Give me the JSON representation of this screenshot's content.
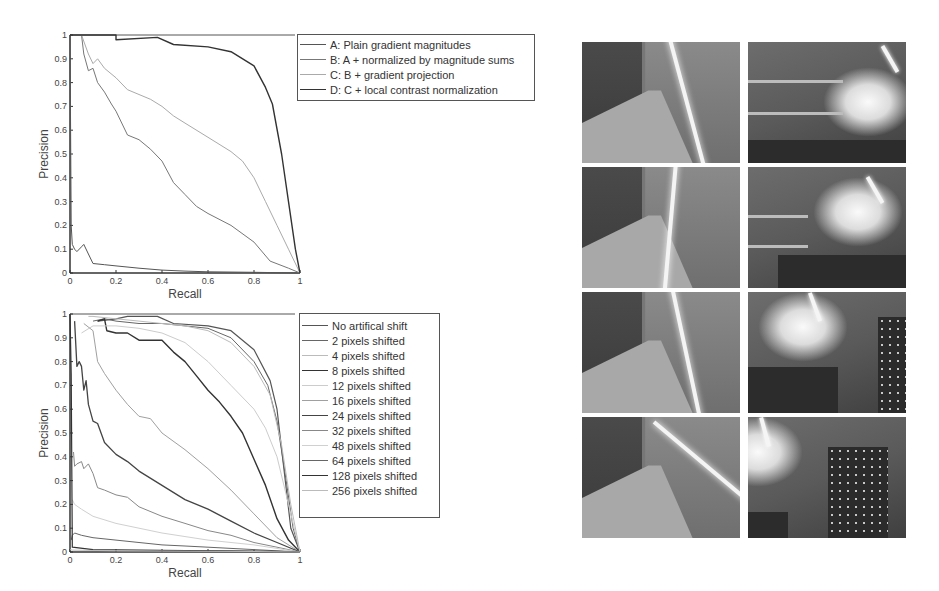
{
  "chart_data": [
    {
      "type": "line",
      "title": "",
      "xlabel": "Recall",
      "ylabel": "Precision",
      "xlim": [
        0,
        1
      ],
      "ylim": [
        0,
        1
      ],
      "xticks": [
        "0",
        "0.2",
        "0.4",
        "0.6",
        "0.8",
        "1"
      ],
      "yticks": [
        "0",
        "0.1",
        "0.2",
        "0.3",
        "0.4",
        "0.5",
        "0.6",
        "0.7",
        "0.8",
        "0.9",
        "1"
      ],
      "grid": false,
      "legend_position": "outside-right-top",
      "series": [
        {
          "name": "A: Plain gradient magnitudes",
          "color": "#555555",
          "width": 1,
          "x": [
            0,
            0.005,
            0.01,
            0.02,
            0.03,
            0.05,
            0.06,
            0.08,
            0.1,
            0.15,
            0.2,
            0.3,
            0.4,
            0.5,
            0.6,
            0.8,
            1.0
          ],
          "y": [
            1.0,
            0.2,
            0.12,
            0.1,
            0.09,
            0.11,
            0.12,
            0.08,
            0.04,
            0.035,
            0.03,
            0.02,
            0.012,
            0.008,
            0.005,
            0.003,
            0.0
          ]
        },
        {
          "name": "B: A + normalized by magnitude sums",
          "color": "#777777",
          "width": 1,
          "x": [
            0.05,
            0.06,
            0.08,
            0.1,
            0.12,
            0.15,
            0.18,
            0.2,
            0.25,
            0.3,
            0.35,
            0.4,
            0.45,
            0.5,
            0.55,
            0.6,
            0.7,
            0.8,
            0.87,
            0.95,
            1.0
          ],
          "y": [
            1.0,
            0.92,
            0.85,
            0.86,
            0.8,
            0.76,
            0.71,
            0.68,
            0.58,
            0.56,
            0.52,
            0.47,
            0.38,
            0.33,
            0.28,
            0.25,
            0.2,
            0.13,
            0.05,
            0.02,
            0.0
          ]
        },
        {
          "name": "C: B + gradient projection",
          "color": "#aaaaaa",
          "width": 1,
          "x": [
            0.05,
            0.08,
            0.1,
            0.12,
            0.15,
            0.2,
            0.25,
            0.3,
            0.35,
            0.4,
            0.45,
            0.5,
            0.6,
            0.7,
            0.75,
            0.8,
            0.85,
            0.9,
            0.95,
            1.0
          ],
          "y": [
            1.0,
            0.92,
            0.88,
            0.9,
            0.86,
            0.82,
            0.77,
            0.75,
            0.73,
            0.7,
            0.66,
            0.63,
            0.57,
            0.51,
            0.47,
            0.4,
            0.3,
            0.2,
            0.1,
            0.0
          ]
        },
        {
          "name": "D: C + local contrast normalization",
          "color": "#333333",
          "width": 1.4,
          "x": [
            0,
            0.2,
            0.2,
            0.38,
            0.45,
            0.6,
            0.7,
            0.8,
            0.85,
            0.88,
            0.92,
            0.95,
            0.98,
            1.0
          ],
          "y": [
            1.0,
            1.0,
            0.98,
            0.99,
            0.96,
            0.95,
            0.93,
            0.87,
            0.78,
            0.71,
            0.5,
            0.3,
            0.1,
            0.0
          ]
        }
      ]
    },
    {
      "type": "line",
      "title": "",
      "xlabel": "Recall",
      "ylabel": "Precision",
      "xlim": [
        0,
        1
      ],
      "ylim": [
        0,
        1
      ],
      "xticks": [
        "0",
        "0.2",
        "0.4",
        "0.6",
        "0.8",
        "1"
      ],
      "yticks": [
        "0",
        "0.1",
        "0.2",
        "0.3",
        "0.4",
        "0.5",
        "0.6",
        "0.7",
        "0.8",
        "0.9",
        "1"
      ],
      "grid": false,
      "legend_position": "outside-right-top",
      "series": [
        {
          "name": "No artifical shift",
          "color": "#555555",
          "width": 1.2,
          "x": [
            0.12,
            0.2,
            0.25,
            0.38,
            0.45,
            0.6,
            0.7,
            0.8,
            0.87,
            0.9,
            0.93,
            0.96,
            1.0
          ],
          "y": [
            0.97,
            0.98,
            0.99,
            0.99,
            0.96,
            0.95,
            0.93,
            0.85,
            0.72,
            0.6,
            0.35,
            0.1,
            0.0
          ]
        },
        {
          "name": "2 pixels shifted",
          "color": "#666666",
          "width": 1,
          "x": [
            0.1,
            0.15,
            0.2,
            0.3,
            0.4,
            0.5,
            0.6,
            0.7,
            0.8,
            0.86,
            0.9,
            0.94,
            0.97,
            1.0
          ],
          "y": [
            0.97,
            0.98,
            0.97,
            0.96,
            0.96,
            0.95,
            0.94,
            0.9,
            0.8,
            0.7,
            0.55,
            0.3,
            0.1,
            0.0
          ]
        },
        {
          "name": "4 pixels shifted",
          "color": "#bbbbbb",
          "width": 1,
          "x": [
            0.08,
            0.1,
            0.2,
            0.3,
            0.4,
            0.5,
            0.6,
            0.7,
            0.8,
            0.87,
            0.92,
            0.96,
            1.0
          ],
          "y": [
            0.99,
            0.99,
            0.98,
            0.97,
            0.96,
            0.95,
            0.93,
            0.88,
            0.78,
            0.66,
            0.45,
            0.2,
            0.0
          ]
        },
        {
          "name": "8 pixels shifted",
          "color": "#333333",
          "width": 1.4,
          "x": [
            0.12,
            0.15,
            0.16,
            0.2,
            0.25,
            0.3,
            0.35,
            0.4,
            0.45,
            0.5,
            0.55,
            0.6,
            0.65,
            0.7,
            0.75,
            0.8,
            0.85,
            0.9,
            0.95,
            1.0
          ],
          "y": [
            0.97,
            0.98,
            0.93,
            0.92,
            0.92,
            0.89,
            0.89,
            0.89,
            0.84,
            0.8,
            0.74,
            0.68,
            0.63,
            0.57,
            0.5,
            0.39,
            0.28,
            0.14,
            0.05,
            0.0
          ]
        },
        {
          "name": "12 pixels shifted",
          "color": "#cccccc",
          "width": 1,
          "x": [
            0.05,
            0.1,
            0.2,
            0.3,
            0.4,
            0.5,
            0.6,
            0.7,
            0.8,
            0.85,
            0.9,
            0.95,
            1.0
          ],
          "y": [
            0.92,
            0.95,
            0.95,
            0.94,
            0.92,
            0.88,
            0.8,
            0.7,
            0.6,
            0.52,
            0.4,
            0.2,
            0.0
          ]
        },
        {
          "name": "16 pixels shifted",
          "color": "#a0a0a0",
          "width": 1,
          "x": [
            0.06,
            0.1,
            0.12,
            0.15,
            0.2,
            0.25,
            0.3,
            0.35,
            0.4,
            0.5,
            0.6,
            0.7,
            0.8,
            0.9,
            1.0
          ],
          "y": [
            0.96,
            0.93,
            0.8,
            0.75,
            0.68,
            0.62,
            0.57,
            0.56,
            0.5,
            0.43,
            0.35,
            0.26,
            0.16,
            0.06,
            0.0
          ]
        },
        {
          "name": "24 pixels shifted",
          "color": "#444444",
          "width": 1.3,
          "x": [
            0.02,
            0.03,
            0.04,
            0.05,
            0.06,
            0.07,
            0.08,
            0.1,
            0.12,
            0.15,
            0.2,
            0.25,
            0.3,
            0.4,
            0.5,
            0.6,
            0.7,
            0.8,
            0.9,
            1.0
          ],
          "y": [
            0.97,
            0.78,
            0.8,
            0.78,
            0.68,
            0.72,
            0.62,
            0.55,
            0.54,
            0.46,
            0.41,
            0.38,
            0.34,
            0.28,
            0.22,
            0.18,
            0.13,
            0.08,
            0.04,
            0.0
          ]
        },
        {
          "name": "32 pixels shifted",
          "color": "#888888",
          "width": 1,
          "x": [
            0.015,
            0.02,
            0.03,
            0.05,
            0.06,
            0.08,
            0.1,
            0.12,
            0.15,
            0.2,
            0.25,
            0.3,
            0.4,
            0.5,
            0.6,
            0.7,
            0.8,
            0.9,
            1.0
          ],
          "y": [
            0.42,
            0.36,
            0.37,
            0.38,
            0.35,
            0.37,
            0.33,
            0.27,
            0.26,
            0.24,
            0.23,
            0.19,
            0.15,
            0.12,
            0.09,
            0.07,
            0.04,
            0.02,
            0.0
          ]
        },
        {
          "name": "48 pixels shifted",
          "color": "#d0d0d0",
          "width": 1,
          "x": [
            0.01,
            0.02,
            0.05,
            0.1,
            0.2,
            0.3,
            0.4,
            0.6,
            0.8,
            1.0
          ],
          "y": [
            0.22,
            0.2,
            0.18,
            0.15,
            0.12,
            0.1,
            0.08,
            0.05,
            0.03,
            0.0
          ]
        },
        {
          "name": "64 pixels shifted",
          "color": "#666666",
          "width": 1,
          "x": [
            0.005,
            0.01,
            0.02,
            0.05,
            0.1,
            0.2,
            0.3,
            0.4,
            0.5,
            0.6,
            0.8,
            1.0
          ],
          "y": [
            0.05,
            0.07,
            0.08,
            0.07,
            0.06,
            0.05,
            0.04,
            0.03,
            0.025,
            0.02,
            0.01,
            0.0
          ]
        },
        {
          "name": "128 pixels shifted",
          "color": "#333333",
          "width": 1.2,
          "x": [
            0,
            0.005,
            0.01,
            0.1,
            0.3,
            0.5,
            0.7,
            0.9,
            1.0
          ],
          "y": [
            1.0,
            0.75,
            0.02,
            0.01,
            0.008,
            0.006,
            0.005,
            0.003,
            0.0
          ]
        },
        {
          "name": "256 pixels shifted",
          "color": "#bbbbbb",
          "width": 1,
          "x": [
            0,
            0.01,
            0.2,
            0.4,
            0.6,
            0.8,
            1.0
          ],
          "y": [
            0.01,
            0.008,
            0.005,
            0.004,
            0.003,
            0.002,
            0.0
          ]
        }
      ]
    }
  ],
  "photos": {
    "grid": [
      {
        "label": "corridor-view-1",
        "type": "corridor"
      },
      {
        "label": "lab-bench-view-1",
        "type": "lab"
      },
      {
        "label": "corridor-view-2",
        "type": "corridor"
      },
      {
        "label": "lab-bench-view-2",
        "type": "lab"
      },
      {
        "label": "corridor-view-3",
        "type": "corridor"
      },
      {
        "label": "lab-bench-view-3",
        "type": "lab"
      },
      {
        "label": "corridor-view-4",
        "type": "corridor"
      },
      {
        "label": "lab-bench-view-4",
        "type": "lab"
      }
    ]
  }
}
